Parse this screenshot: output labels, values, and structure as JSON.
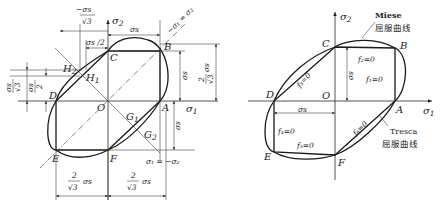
{
  "left_diagram": {
    "points": {
      "A": "A",
      "B": "B",
      "C": "C",
      "D": "D",
      "E": "E",
      "F": "F",
      "O": "O",
      "G1": "G",
      "G1_sub": "1",
      "G2": "G",
      "G2_sub": "2",
      "H1": "H",
      "H1_sub": "1",
      "H2": "H",
      "H2_sub": "2"
    },
    "axes": {
      "x": "σ",
      "x_sub": "1",
      "y": "σ",
      "y_sub": "2"
    },
    "diagonal_pos": "σ₁ = σ₂",
    "diagonal_pos_prefix": "−",
    "diagonal_neg": "σ₁ = −σ₂",
    "dims": {
      "top_neg": "σs",
      "top_neg_prefix": "−",
      "top_neg_den": "√3",
      "half": "σs /2",
      "top_right": "σs",
      "right_small": "σs",
      "right_big_num": "2",
      "right_big_den": "√3",
      "right_big_var": "σs",
      "left_a_num": "σs",
      "left_a_den": "√3",
      "left_b_num": "σs",
      "left_b_den": "2",
      "lower_right": "σs",
      "bottom_left_num": "2",
      "bottom_left_den": "√3",
      "bottom_left_var": "σs",
      "bottom_right_num": "2",
      "bottom_right_den": "√3",
      "bottom_right_var": "σs"
    }
  },
  "right_diagram": {
    "points": {
      "A": "A",
      "B": "B",
      "C": "C",
      "D": "D",
      "E": "E",
      "F": "F",
      "O": "O"
    },
    "axes": {
      "x": "σ",
      "x_sub": "1",
      "y": "σ",
      "y_sub": "2"
    },
    "miese_label": "Miese",
    "miese_cn": "屈服曲线",
    "tresca_label": "Tresca",
    "tresca_cn": "屈服曲线",
    "faces": {
      "f1": "f₁=0",
      "f2": "f₂=0",
      "f3": "f₃=0",
      "f4": "f₄=0",
      "f5": "f₅=0",
      "f6": "f₆=0"
    },
    "dims": {
      "vertical": "σs",
      "horizontal": "σs"
    }
  }
}
